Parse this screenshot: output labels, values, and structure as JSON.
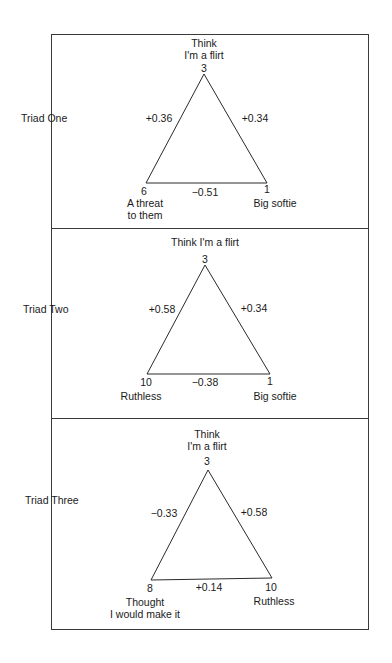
{
  "triads": [
    {
      "label": "Triad One",
      "top": {
        "label_line1": "Think",
        "label_line2": "I'm a flirt",
        "rank": "3"
      },
      "left": {
        "label_line1": "A threat",
        "label_line2": "to them",
        "rank": "6"
      },
      "right": {
        "label_line1": "Big softie",
        "label_line2": "",
        "rank": "1"
      },
      "edges": {
        "left": "+0.36",
        "right": "+0.34",
        "bottom": "−0.51"
      }
    },
    {
      "label": "Triad Two",
      "top": {
        "label_line1": "Think  I'm a flirt",
        "label_line2": "",
        "rank": "3"
      },
      "left": {
        "label_line1": "Ruthless",
        "label_line2": "",
        "rank": "10"
      },
      "right": {
        "label_line1": "Big softie",
        "label_line2": "",
        "rank": "1"
      },
      "edges": {
        "left": "+0.58",
        "right": "+0.34",
        "bottom": "−0.38"
      }
    },
    {
      "label": "Triad Three",
      "top": {
        "label_line1": "Think",
        "label_line2": "I'm a flirt",
        "rank": "3"
      },
      "left": {
        "label_line1": "Thought",
        "label_line2": "I would make it",
        "rank": "8"
      },
      "right": {
        "label_line1": "Ruthless",
        "label_line2": "",
        "rank": "10"
      },
      "edges": {
        "left": "−0.33",
        "right": "+0.58",
        "bottom": "+0.14"
      }
    }
  ],
  "colors": {
    "line": "#2a2a2a",
    "text": "#1a1a1a",
    "background": "#ffffff"
  }
}
